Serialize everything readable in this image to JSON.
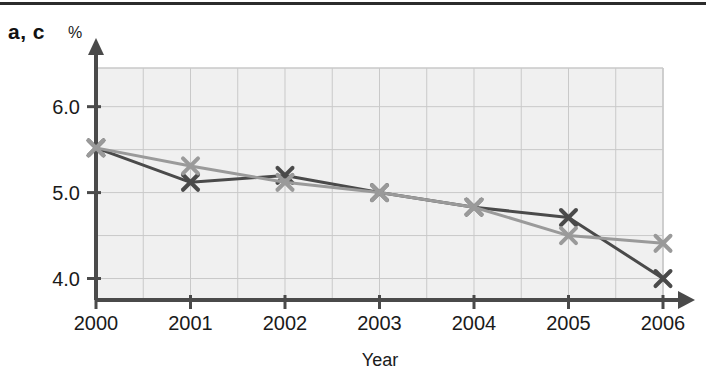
{
  "figure": {
    "panel_label": "a, c",
    "unit_label": "%"
  },
  "chart_data": {
    "type": "line",
    "title": "",
    "subtitle": "",
    "xlabel": "Year",
    "ylabel": "%",
    "categories": [
      "2000",
      "2001",
      "2002",
      "2003",
      "2004",
      "2005",
      "2006"
    ],
    "x": [
      2000,
      2001,
      2002,
      2003,
      2004,
      2005,
      2006
    ],
    "series": [
      {
        "name": "a",
        "color": "#4a4a4a",
        "marker": "x",
        "values": [
          5.52,
          5.12,
          5.2,
          5.0,
          4.83,
          4.71,
          4.0
        ]
      },
      {
        "name": "c",
        "color": "#9a9a9a",
        "marker": "x",
        "values": [
          5.52,
          5.31,
          5.12,
          5.0,
          4.83,
          4.5,
          4.41
        ]
      }
    ],
    "xlim": [
      2000,
      2006
    ],
    "ylim": [
      3.75,
      6.45
    ],
    "ytick_labels": [
      "6.0",
      "5.0",
      "4.0"
    ],
    "ytick_values": [
      6.0,
      5.0,
      4.0
    ],
    "xtick_labels": [
      "2000",
      "2001",
      "2002",
      "2003",
      "2004",
      "2005",
      "2006"
    ],
    "grid": true,
    "grid_y_values": [
      6.0,
      5.5,
      5.0,
      4.5,
      4.0
    ],
    "grid_x_step": 0.5,
    "legend": "none",
    "plot_background": "#f0f0f0",
    "grid_color": "#c9c9c9",
    "axis_color": "#4a4a4a"
  }
}
